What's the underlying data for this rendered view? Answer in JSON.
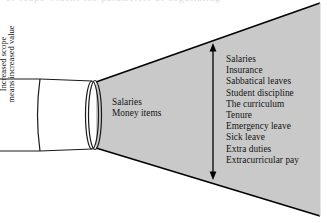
{
  "figure": {
    "type": "funnel-cone-diagram",
    "fill_color": "#c9c9c9",
    "stroke_color": "#000000",
    "background_color": "#ffffff",
    "text_color": "#141414",
    "cut_off_caption_above": "of scope widens the parameters of negotiating"
  },
  "inner_labels": {
    "items": [
      "Salaries",
      "Money items"
    ]
  },
  "scope_arrow": {
    "caption_line_1": "Increased scope",
    "caption_line_2": "means increased value",
    "orientation": "vertical-double-headed"
  },
  "outcome_list": {
    "items": [
      "Salaries",
      "Insurance",
      "Sabbatical leaves",
      "Student discipline",
      "The curriculum",
      "Tenure",
      "Emergency leave",
      "Sick leave",
      "Extra duties",
      "Extracurricular pay"
    ]
  }
}
